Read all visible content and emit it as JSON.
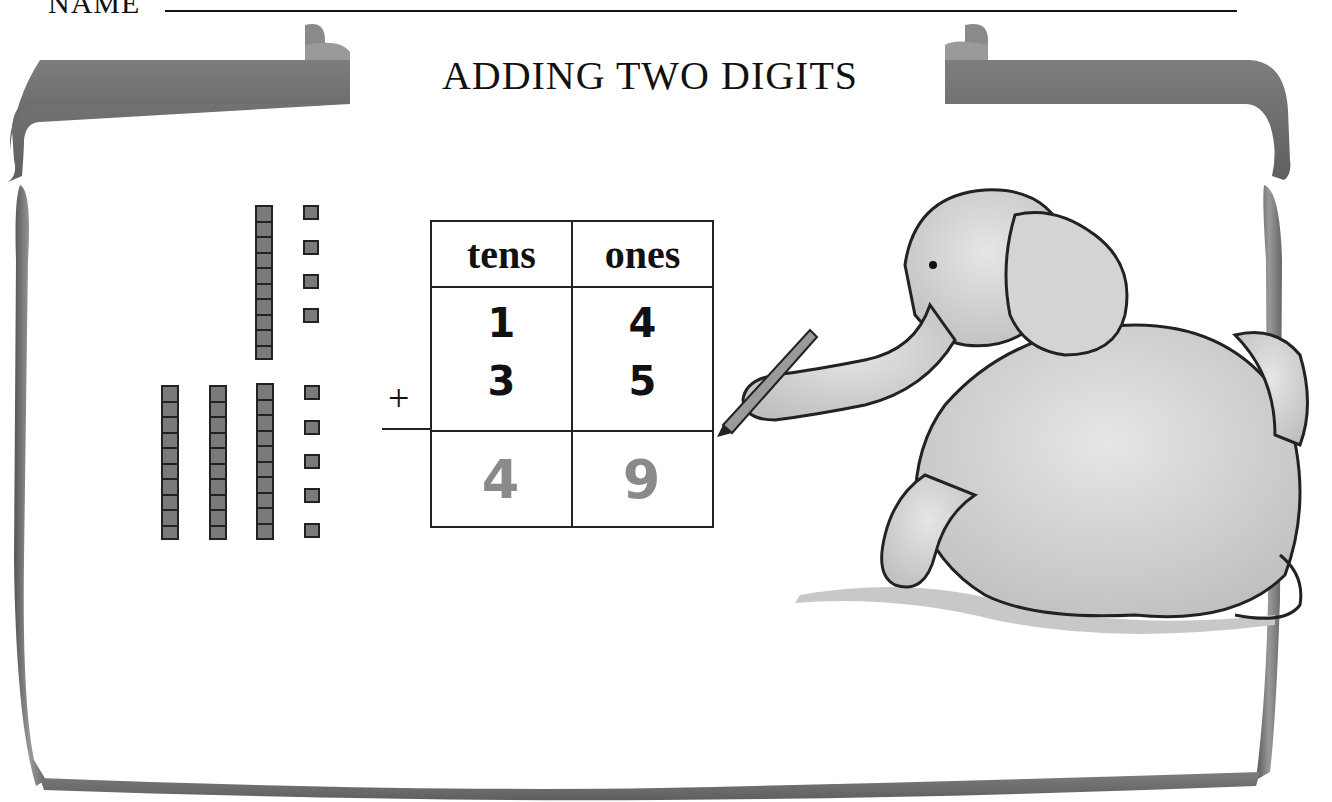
{
  "header": {
    "name_label": "NAME"
  },
  "title": "ADDING TWO DIGITS",
  "blocks": {
    "top_number": {
      "tens_rods": 1,
      "ones_units": 4
    },
    "bottom_number": {
      "tens_rods": 3,
      "ones_units": 5
    }
  },
  "table": {
    "headers": [
      "tens",
      "ones"
    ],
    "operator": "+",
    "rows": [
      {
        "tens": "1",
        "ones": "4"
      },
      {
        "tens": "3",
        "ones": "5"
      }
    ],
    "answer": {
      "tens": "4",
      "ones": "9"
    }
  },
  "illustration": {
    "subject": "elephant holding pencil"
  },
  "colors": {
    "ribbon": "#6f6f6f",
    "blocks": "#7a7a7a",
    "answer_digits": "#8a8a8a"
  }
}
